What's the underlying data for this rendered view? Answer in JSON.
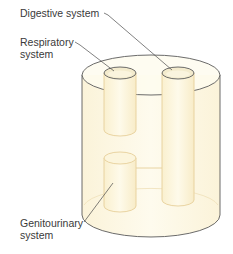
{
  "diagram": {
    "labels": {
      "digestive": "Digestive system",
      "respiratory": [
        "Respiratory",
        "system"
      ],
      "genitourinary": [
        "Genitourinary",
        "system"
      ]
    },
    "colors": {
      "body_fill": "#fdf8e6",
      "body_stroke": "#4a4a4a",
      "tube_fill": "#fcf4d8",
      "tube_stroke": "#e6cf9a",
      "opening_fill": "#f4ecd0",
      "leader_line": "#4a4a4a",
      "text": "#3a3a3a"
    }
  }
}
